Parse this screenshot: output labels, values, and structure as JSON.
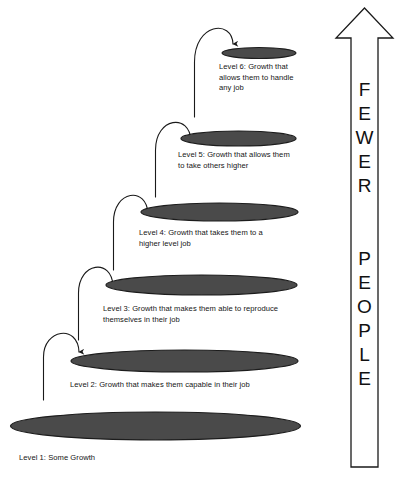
{
  "diagram": {
    "background_color": "#ffffff",
    "ellipse_fill": "#4a4a4a",
    "ellipse_stroke": "#1c1c1c",
    "line_color": "#1a1a1a",
    "levels": [
      {
        "id": "level-1",
        "label": "Level 1: Some Growth",
        "ellipse": {
          "cx": 155.5,
          "cy": 426,
          "rx": 145,
          "ry": 14
        },
        "label_pos": {
          "x": 19,
          "y": 457
        }
      },
      {
        "id": "level-2",
        "label": "Level 2: Growth that makes them capable in their job",
        "ellipse": {
          "cx": 184.5,
          "cy": 361,
          "rx": 113.5,
          "ry": 11
        },
        "label_pos": {
          "x": 70,
          "y": 385
        }
      },
      {
        "id": "level-3",
        "label": "Level 3: Growth that makes them able to reproduce\nthemselves in their job",
        "ellipse": {
          "cx": 201.5,
          "cy": 285,
          "rx": 95.5,
          "ry": 10
        },
        "label_pos": {
          "x": 103,
          "y": 308
        }
      },
      {
        "id": "level-4",
        "label": "Level 4: Growth that takes them to a\nhigher level job",
        "ellipse": {
          "cx": 219.5,
          "cy": 212,
          "rx": 78.5,
          "ry": 9
        },
        "label_pos": {
          "x": 139,
          "y": 233
        }
      },
      {
        "id": "level-5",
        "label": "Level 5: Growth that allows them\nto take others higher",
        "ellipse": {
          "cx": 238.5,
          "cy": 138.5,
          "rx": 57.5,
          "ry": 7.5
        },
        "label_pos": {
          "x": 178,
          "y": 155
        }
      },
      {
        "id": "level-6",
        "label": "Level 6: Growth that\nallows them to handle\nany job",
        "ellipse": {
          "cx": 259,
          "cy": 53,
          "rx": 37,
          "ry": 5.5
        },
        "label_pos": {
          "x": 219,
          "y": 68
        }
      }
    ],
    "connector_arrows": [
      {
        "id": "arrow-1-to-2",
        "from_level": "level-1",
        "to_level": "level-2"
      },
      {
        "id": "arrow-2-to-3",
        "from_level": "level-2",
        "to_level": "level-3"
      },
      {
        "id": "arrow-3-to-4",
        "from_level": "level-3",
        "to_level": "level-4"
      },
      {
        "id": "arrow-4-to-5",
        "from_level": "level-4",
        "to_level": "level-5"
      },
      {
        "id": "arrow-5-to-6",
        "from_level": "level-5",
        "to_level": "level-6"
      }
    ],
    "side_arrow": {
      "id": "fewer-people-arrow",
      "direction": "up",
      "line1": "FEWER",
      "line2": "PEOPLE",
      "letters_fewer": [
        "F",
        "E",
        "W",
        "E",
        "R"
      ],
      "letters_people": [
        "P",
        "E",
        "O",
        "P",
        "L",
        "E"
      ],
      "letter_color": "#111111",
      "outline_color": "#1a1a1a"
    }
  }
}
